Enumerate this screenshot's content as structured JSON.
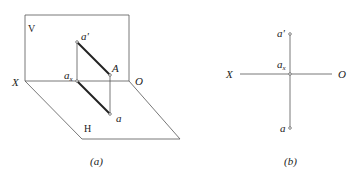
{
  "figure_a": {
    "caption": "(a)",
    "plane_v_label": "V",
    "plane_h_label": "H",
    "axis_x_label": "X",
    "origin_label": "O",
    "point_a_prime_label": "a'",
    "point_A_label": "A",
    "point_ax_label": "a",
    "point_ax_subscript": "x",
    "point_a_label": "a"
  },
  "figure_b": {
    "caption": "(b)",
    "axis_x_label": "X",
    "origin_label": "O",
    "point_a_prime_label": "a'",
    "point_ax_label": "a",
    "point_ax_subscript": "x",
    "point_a_label": "a"
  }
}
